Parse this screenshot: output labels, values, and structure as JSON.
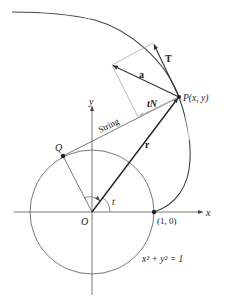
{
  "diagram": {
    "type": "involute-of-circle",
    "labels": {
      "x_axis": "x",
      "y_axis": "y",
      "origin": "O",
      "point_Q": "Q",
      "point_P": "P(x, y)",
      "unit_point": "(1, 0)",
      "angle": "t",
      "string": "String",
      "vector_r": "r",
      "vector_T": "T",
      "vector_a": "a",
      "vector_tN": "tN",
      "circle_eq": "x² + y² = 1"
    },
    "colors": {
      "line": "#333333",
      "thin_line": "#555555",
      "faint": "#9a9a9a",
      "text": "#222222"
    }
  }
}
